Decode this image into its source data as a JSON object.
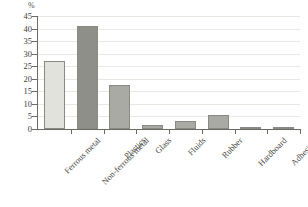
{
  "chart_data": {
    "type": "bar",
    "title": "",
    "subtitle": "",
    "xlabel": "",
    "ylabel": "%",
    "unit_label": "%",
    "categories": [
      "Ferrous metal",
      "Non-ferrous metal",
      "Plastics",
      "Glass",
      "Fluids",
      "Rubber",
      "Hardboard",
      "Adhesives"
    ],
    "values": [
      27,
      41,
      17.5,
      1.5,
      3,
      5.5,
      0.5,
      0.4
    ],
    "bar_colors": [
      "#e2e2dd",
      "#8f8f8a",
      "#aaaaa5",
      "#aaaaa5",
      "#aaaaa5",
      "#aaaaa5",
      "#8f8f8a",
      "#8f8f8a"
    ],
    "bar_border_color": "#8a8a85",
    "ylim": [
      0,
      45
    ],
    "ytick_values": [
      0,
      5,
      10,
      15,
      20,
      25,
      30,
      35,
      40,
      45
    ],
    "ytick_labels": [
      "0",
      "5",
      "10",
      "15",
      "20",
      "25",
      "30",
      "35",
      "40",
      "45"
    ],
    "grid": true,
    "grid_color": "#e9e9e4",
    "axis_color": "#6b6b66",
    "legend": null,
    "legend_position": "none",
    "label_rotation": -45,
    "background": "#ffffff"
  }
}
